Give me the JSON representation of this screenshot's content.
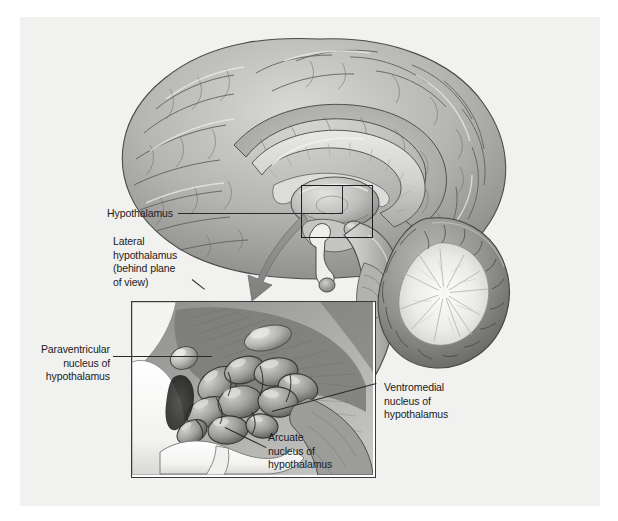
{
  "figure": {
    "title": "Hypothalamus",
    "style": "grayscale medical illustration",
    "panel_background": "#f1f1f0",
    "page_background": "#ffffff",
    "ink_color": "#1b1b1b",
    "arrow_color": "#8d8d8d"
  },
  "labels": {
    "hypothalamus": "Hypothalamus",
    "lateral_hypothalamus": "Lateral\nhypothalamus\n(behind plane\nof view)",
    "paraventricular": "Paraventricular\nnucleus of\nhypothalamus",
    "ventromedial": "Ventromedial\nnucleus of\nhypothalamus",
    "arcuate": "Arcuate\nnucleus of\nhypothalamus"
  },
  "structures": {
    "cerebrum": "cerebral cortex",
    "corpus_callosum": "corpus callosum",
    "thalamus": "thalamus",
    "cerebellum": "cerebellum",
    "brainstem": "brainstem",
    "pituitary": "pituitary gland",
    "optic_chiasm": "optic chiasm",
    "third_ventricle": "third ventricle"
  },
  "callout": {
    "box_label": "hypothalamus-region-callout",
    "arrow_label": "magnification-arrow"
  }
}
